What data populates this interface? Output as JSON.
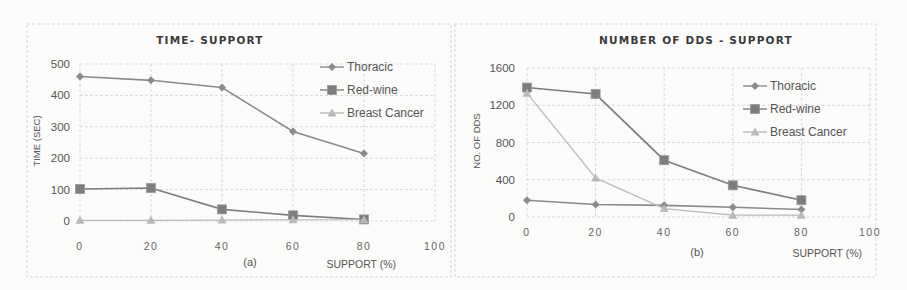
{
  "figure": {
    "panels": [
      {
        "title": "TIME- SUPPORT",
        "subcaption": "(a)",
        "xlabel": "SUPPORT (%)",
        "ylabel": "TIME (SEC)"
      },
      {
        "title": "NUMBER OF DDS - SUPPORT",
        "subcaption": "(b)",
        "xlabel": "SUPPORT (%)",
        "ylabel": "NO. OF DDS"
      }
    ]
  },
  "colors": {
    "thoracic": "#8a8a8a",
    "red_wine": "#7d7d7d",
    "breast_cancer": "#b9b9b9",
    "grid": "#d9d9d9"
  },
  "chart_data": [
    {
      "type": "line",
      "title": "TIME- SUPPORT",
      "subcaption": "(a)",
      "xlabel": "SUPPORT (%)",
      "ylabel": "TIME (SEC)",
      "x": [
        0,
        20,
        40,
        60,
        80
      ],
      "xticks": [
        0,
        20,
        40,
        60,
        80,
        100
      ],
      "yticks": [
        0,
        100,
        200,
        300,
        400,
        500
      ],
      "xlim": [
        0,
        100
      ],
      "ylim": [
        0,
        500
      ],
      "grid": true,
      "legend_position": "upper right (inside)",
      "series": [
        {
          "name": "Thoracic",
          "marker": "diamond",
          "values": [
            460,
            448,
            425,
            285,
            215
          ]
        },
        {
          "name": "Red-wine",
          "marker": "square",
          "values": [
            102,
            105,
            37,
            18,
            5
          ]
        },
        {
          "name": "Breast Cancer",
          "marker": "triangle",
          "values": [
            2,
            2,
            3,
            4,
            4
          ]
        }
      ]
    },
    {
      "type": "line",
      "title": "NUMBER OF DDS - SUPPORT",
      "subcaption": "(b)",
      "xlabel": "SUPPORT (%)",
      "ylabel": "NO. OF DDS",
      "x": [
        0,
        20,
        40,
        60,
        80
      ],
      "xticks": [
        0,
        20,
        40,
        60,
        80,
        100
      ],
      "yticks": [
        0,
        400,
        800,
        1200,
        1600
      ],
      "xlim": [
        0,
        100
      ],
      "ylim": [
        0,
        1600
      ],
      "grid": true,
      "legend_position": "right (inside)",
      "series": [
        {
          "name": "Thoracic",
          "marker": "diamond",
          "values": [
            180,
            135,
            125,
            105,
            80
          ]
        },
        {
          "name": "Red-wine",
          "marker": "square",
          "values": [
            1390,
            1320,
            610,
            340,
            180
          ]
        },
        {
          "name": "Breast Cancer",
          "marker": "triangle",
          "values": [
            1330,
            420,
            90,
            20,
            20
          ]
        }
      ]
    }
  ]
}
